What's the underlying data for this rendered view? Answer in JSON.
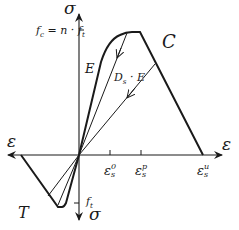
{
  "diagram": {
    "axes": {
      "sigma_top_label": "σ",
      "sigma_bottom_label": "σ",
      "epsilon_right_label": "ε",
      "epsilon_left_label": "ε"
    },
    "regions": {
      "compression": "C",
      "tension": "T"
    },
    "labels": {
      "fc_eq": "f",
      "fc_sub": "c",
      "fc_rhs": " = n · f",
      "fc_rhs_sub": "t",
      "ft": "f",
      "ft_sub": "t",
      "modulus": "E",
      "damaged_modulus_D": "D",
      "damaged_modulus_sub": "s",
      "damaged_modulus_rest": " · E"
    },
    "strain_ticks": [
      {
        "base": "ε",
        "sub": "s",
        "sup": "0"
      },
      {
        "base": "ε",
        "sub": "s",
        "sup": "p"
      },
      {
        "base": "ε",
        "sub": "s",
        "sup": "u"
      }
    ],
    "colors": {
      "line": "#1a1a1a",
      "background": "#ffffff"
    }
  }
}
